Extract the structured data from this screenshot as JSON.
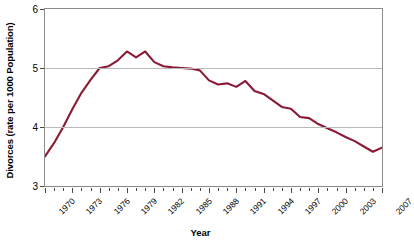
{
  "chart_data": {
    "type": "line",
    "title": "",
    "xlabel": "Year",
    "ylabel": "Divorces (rate per 1000 Population)",
    "xlim": [
      1970,
      2007
    ],
    "ylim": [
      3,
      6
    ],
    "ytick_labels": [
      "3",
      "4",
      "5",
      "6"
    ],
    "ytick_values": [
      3,
      4,
      5,
      6
    ],
    "xtick_labels": [
      "1970",
      "1973",
      "1976",
      "1979",
      "1982",
      "1985",
      "1988",
      "1991",
      "1994",
      "1997",
      "2000",
      "2003",
      "2007"
    ],
    "xtick_values": [
      1970,
      1973,
      1976,
      1979,
      1982,
      1985,
      1988,
      1991,
      1994,
      1997,
      2000,
      2003,
      2007
    ],
    "grid": "horizontal-at-4-and-5",
    "legend": "none",
    "line_color": "#8B1A35",
    "x": [
      1970,
      1971,
      1972,
      1973,
      1974,
      1975,
      1976,
      1977,
      1978,
      1979,
      1980,
      1981,
      1982,
      1983,
      1984,
      1985,
      1986,
      1987,
      1988,
      1989,
      1990,
      1991,
      1992,
      1993,
      1994,
      1995,
      1996,
      1997,
      1998,
      1999,
      2000,
      2001,
      2002,
      2003,
      2004,
      2005,
      2006,
      2007
    ],
    "values": [
      3.5,
      3.73,
      4.0,
      4.3,
      4.58,
      4.8,
      5.0,
      5.03,
      5.13,
      5.28,
      5.18,
      5.28,
      5.1,
      5.03,
      5.01,
      5.0,
      4.99,
      4.96,
      4.79,
      4.72,
      4.74,
      4.68,
      4.78,
      4.61,
      4.56,
      4.45,
      4.34,
      4.31,
      4.17,
      4.15,
      4.05,
      3.98,
      3.91,
      3.83,
      3.76,
      3.67,
      3.58,
      3.65
    ],
    "series_name": "Divorces per 1000 population"
  }
}
